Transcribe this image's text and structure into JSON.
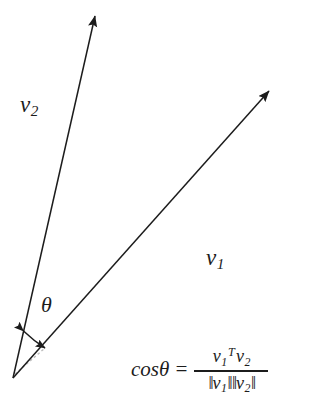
{
  "figure": {
    "type": "vector-angle-diagram",
    "background_color": "#ffffff",
    "stroke_color": "#1c1c1c",
    "dashed_color": "#b0b0b0"
  },
  "labels": {
    "v2": {
      "base": "v",
      "subscript": "2"
    },
    "v1": {
      "base": "v",
      "subscript": "1"
    },
    "theta": "θ"
  },
  "formula": {
    "lhs": "cosθ",
    "equals": "=",
    "numerator": {
      "first_base": "v",
      "first_subscript": "1",
      "transpose": "T",
      "second_base": "v",
      "second_subscript": "2"
    },
    "denominator": {
      "open_1": "‖",
      "first_base": "v",
      "first_subscript": "1",
      "close_1": "‖",
      "open_2": "‖",
      "second_base": "v",
      "second_subscript": "2",
      "close_2": "‖"
    },
    "plain_text": "cosθ = v1^T v2 / (||v1|| ||v2||)"
  },
  "geometry": {
    "origin": {
      "x": 13,
      "y": 378
    },
    "vector_v2_tip": {
      "x": 96,
      "y": 12
    },
    "vector_v1_tip": {
      "x": 272,
      "y": 88
    },
    "angle_arc": {
      "start": {
        "x": 22,
        "y": 329
      },
      "end": {
        "x": 45,
        "y": 347
      },
      "double_headed": true
    },
    "dashed_hint": {
      "start": {
        "x": 15,
        "y": 374
      },
      "end": {
        "x": 44,
        "y": 349
      }
    }
  }
}
